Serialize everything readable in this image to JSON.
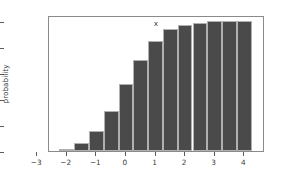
{
  "chart_data": {
    "type": "bar",
    "title": "",
    "xlabel": "x",
    "ylabel": "probability",
    "xlim": [
      -2.6,
      4.7
    ],
    "ylim": [
      0.0,
      1.05
    ],
    "grid": false,
    "legend": null,
    "bar_color": "#4a4a4a",
    "bar_edge_color": "#b0b0b0",
    "bar_width": 0.5,
    "xticks": [
      -3,
      -2,
      -1,
      0,
      1,
      2,
      3,
      4
    ],
    "xtick_labels": [
      "−3",
      "−2",
      "−1",
      "0",
      "1",
      "2",
      "3",
      "4"
    ],
    "yticks": [
      0.0,
      0.2,
      0.4,
      0.6,
      0.8,
      1.0
    ],
    "ytick_labels": [
      "0.0",
      "0.2",
      "0.4",
      "0.6",
      "0.8",
      "1.0"
    ],
    "x": [
      -2.0,
      -1.5,
      -1.0,
      -0.5,
      0.0,
      0.5,
      1.0,
      1.5,
      2.0,
      2.5,
      3.0,
      3.5,
      4.0
    ],
    "values": [
      0.015,
      0.06,
      0.155,
      0.31,
      0.52,
      0.705,
      0.85,
      0.94,
      0.975,
      0.99,
      1.0,
      1.0,
      1.0
    ],
    "categories": [
      "-2.0",
      "-1.5",
      "-1.0",
      "-0.5",
      "0.0",
      "0.5",
      "1.0",
      "1.5",
      "2.0",
      "2.5",
      "3.0",
      "3.5",
      "4.0"
    ]
  }
}
